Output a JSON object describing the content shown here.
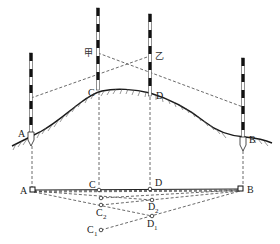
{
  "diagram": {
    "type": "surveying-line-extension-over-hill",
    "elevation": {
      "poles": [
        {
          "id": "A",
          "label": "A",
          "x": 31,
          "top": 53,
          "bottom": 134
        },
        {
          "id": "C",
          "label": "C",
          "marker": "甲",
          "x": 98,
          "top": 8,
          "bottom": 90
        },
        {
          "id": "D",
          "label": "D",
          "marker": "乙",
          "x": 150,
          "top": 14,
          "bottom": 97
        },
        {
          "id": "B",
          "label": "B",
          "x": 243,
          "top": 58,
          "bottom": 146
        }
      ],
      "markers": {
        "jia": "甲",
        "yi": "乙"
      }
    },
    "plan": {
      "line_label_start": "A",
      "line_label_end": "B",
      "points": [
        {
          "label": "C",
          "sub": "",
          "x": 99,
          "y": 190
        },
        {
          "label": "D",
          "sub": "",
          "x": 150,
          "y": 189
        },
        {
          "label": "C",
          "sub": "2",
          "x": 101,
          "y": 205
        },
        {
          "label": "D",
          "sub": "2",
          "x": 152,
          "y": 200
        },
        {
          "label": "C",
          "sub": "1",
          "x": 101,
          "y": 230
        },
        {
          "label": "D",
          "sub": "1",
          "x": 152,
          "y": 216
        }
      ]
    },
    "labels": {
      "A_top": "A",
      "B_top": "B",
      "C_top": "C",
      "D_top": "D",
      "A_plan": "A",
      "B_plan": "B",
      "C_plan": "C",
      "D_plan": "D",
      "C2": "C",
      "C2_sub": "2",
      "D2": "D",
      "D2_sub": "2",
      "C1": "C",
      "C1_sub": "1",
      "D1": "D",
      "D1_sub": "1",
      "jia": "甲",
      "yi": "乙"
    }
  }
}
